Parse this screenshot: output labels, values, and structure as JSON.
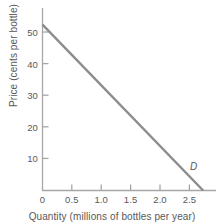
{
  "chart_data": {
    "type": "line",
    "title": "",
    "xlabel": "Quantity (millions of bottles per year)",
    "ylabel": "Price (cents per bottle)",
    "xlim": [
      0,
      2.7
    ],
    "ylim": [
      0,
      55
    ],
    "xticks": [
      "0",
      "0.5",
      "1.0",
      "1.5",
      "2.0",
      "2.5"
    ],
    "xtick_values": [
      0,
      0.5,
      1.0,
      1.5,
      2.0,
      2.5
    ],
    "yticks": [
      "0",
      "10",
      "20",
      "30",
      "40",
      "50"
    ],
    "ytick_values": [
      0,
      10,
      20,
      30,
      40,
      50
    ],
    "grid": false,
    "legend": "none",
    "series": [
      {
        "name": "D",
        "label": "D",
        "label_style": "italic",
        "color": "#8c8c8e",
        "x": [
          0,
          2.5
        ],
        "y": [
          50,
          0
        ],
        "points": [
          {
            "x": 0,
            "y": 50
          },
          {
            "x": 0.5,
            "y": 40
          },
          {
            "x": 1.0,
            "y": 30
          },
          {
            "x": 1.5,
            "y": 20
          },
          {
            "x": 2.0,
            "y": 10
          },
          {
            "x": 2.5,
            "y": 0
          }
        ]
      }
    ],
    "annotations": [
      {
        "text": "D",
        "x": 2.55,
        "y": 4,
        "style": "italic"
      }
    ]
  },
  "axes": {
    "axis_color": "#a6a6a8",
    "tick_color": "#a6a6a8",
    "text_color": "#58585a",
    "background": "#ffffff"
  }
}
